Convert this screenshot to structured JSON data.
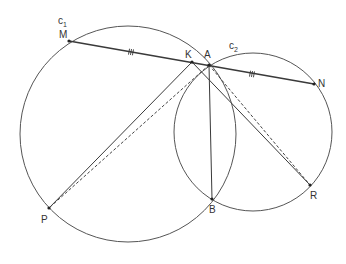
{
  "diagram": {
    "colors": {
      "stroke": "#555555",
      "point": "#222222",
      "label": "#333333",
      "background": "#ffffff"
    },
    "circles": [
      {
        "id": "c1",
        "label": "c",
        "sub": "1",
        "cx": 128,
        "cy": 134,
        "r": 108,
        "label_x": 58,
        "label_y": 24
      },
      {
        "id": "c2",
        "label": "c",
        "sub": "2",
        "cx": 253,
        "cy": 132,
        "r": 79,
        "label_x": 229,
        "label_y": 49
      }
    ],
    "points": [
      {
        "id": "M",
        "label": "M",
        "x": 69,
        "y": 41,
        "lx": 59,
        "ly": 38
      },
      {
        "id": "K",
        "label": "K",
        "x": 192,
        "y": 62,
        "lx": 185,
        "ly": 58
      },
      {
        "id": "A",
        "label": "A",
        "x": 209,
        "y": 65,
        "lx": 204,
        "ly": 58
      },
      {
        "id": "N",
        "label": "N",
        "x": 314,
        "y": 84,
        "lx": 318,
        "ly": 87
      },
      {
        "id": "P",
        "label": "P",
        "x": 49,
        "y": 208,
        "lx": 41,
        "ly": 223
      },
      {
        "id": "B",
        "label": "B",
        "x": 212,
        "y": 199,
        "lx": 209,
        "ly": 213
      },
      {
        "id": "R",
        "label": "R",
        "x": 310,
        "y": 185,
        "lx": 310,
        "ly": 199
      }
    ],
    "segments": [
      {
        "from": "M",
        "to": "N",
        "style": "solid",
        "width": 1.6
      },
      {
        "from": "K",
        "to": "P",
        "style": "solid",
        "width": 1
      },
      {
        "from": "K",
        "to": "R",
        "style": "solid",
        "width": 1
      },
      {
        "from": "A",
        "to": "B",
        "style": "solid",
        "width": 1
      },
      {
        "from": "A",
        "to": "P",
        "style": "dashed",
        "width": 1
      },
      {
        "from": "A",
        "to": "R",
        "style": "dashed",
        "width": 1
      }
    ],
    "tick_marks": [
      {
        "segment": "M-K",
        "count": 3,
        "x": 131,
        "y": 52
      },
      {
        "segment": "A-N",
        "count": 3,
        "x": 252,
        "y": 74
      }
    ]
  }
}
